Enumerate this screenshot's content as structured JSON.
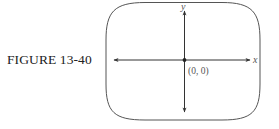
{
  "figure": {
    "caption": "FIGURE 13-40"
  },
  "diagram": {
    "type": "coordinate-axes-in-rounded-frame",
    "x_axis_label": "x",
    "y_axis_label": "y",
    "origin_label": "(0, 0)",
    "colors": {
      "frame": "#555555",
      "axes": "#333333",
      "origin_point": "#222222",
      "text": "#555555"
    }
  }
}
